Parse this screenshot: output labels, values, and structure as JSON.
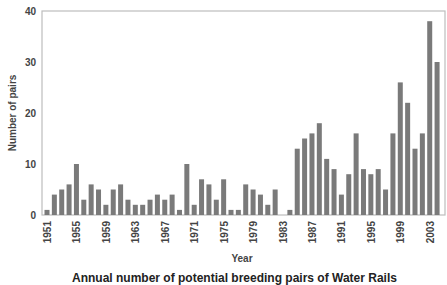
{
  "chart_data": {
    "type": "bar",
    "title": "",
    "xlabel": "Year",
    "ylabel": "Number of pairs",
    "ylim": [
      0,
      40
    ],
    "yticks": [
      0,
      10,
      20,
      30,
      40
    ],
    "xtick_labels": [
      "1951",
      "1955",
      "1959",
      "1963",
      "1967",
      "1971",
      "1975",
      "1979",
      "1983",
      "1987",
      "1991",
      "1995",
      "1999",
      "2003"
    ],
    "grid": false,
    "legend": null,
    "bar_color": "#7a7a7a",
    "categories": [
      "1951",
      "1952",
      "1953",
      "1954",
      "1955",
      "1956",
      "1957",
      "1958",
      "1959",
      "1960",
      "1961",
      "1962",
      "1963",
      "1964",
      "1965",
      "1966",
      "1967",
      "1968",
      "1969",
      "1970",
      "1971",
      "1972",
      "1973",
      "1974",
      "1975",
      "1976",
      "1977",
      "1978",
      "1979",
      "1980",
      "1981",
      "1982",
      "1983",
      "1984",
      "1985",
      "1986",
      "1987",
      "1988",
      "1989",
      "1990",
      "1991",
      "1992",
      "1993",
      "1994",
      "1995",
      "1996",
      "1997",
      "1998",
      "1999",
      "2000",
      "2001",
      "2002",
      "2003",
      "2004"
    ],
    "values": [
      1,
      4,
      5,
      6,
      10,
      3,
      6,
      5,
      2,
      5,
      6,
      3,
      2,
      2,
      3,
      4,
      3,
      4,
      1,
      10,
      2,
      7,
      6,
      3,
      7,
      1,
      1,
      6,
      5,
      4,
      2,
      5,
      0,
      1,
      13,
      15,
      16,
      18,
      11,
      9,
      4,
      8,
      16,
      9,
      8,
      9,
      5,
      16,
      26,
      22,
      13,
      16,
      38,
      30
    ]
  },
  "labels": {
    "ylabel": "Number of pairs",
    "xlabel": "Year",
    "caption": "Annual number of potential breeding pairs of Water Rails"
  }
}
